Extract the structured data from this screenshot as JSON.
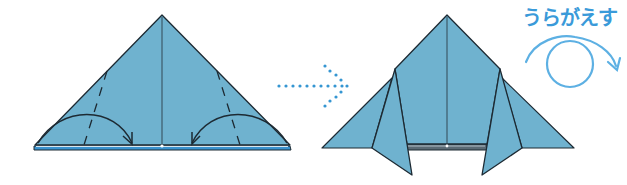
{
  "instruction": {
    "flip_label": "うらがえす"
  },
  "colors": {
    "paper_fill": "#6fb2cf",
    "paper_edge": "#1d2a33",
    "accent_blue": "#4aa3d8",
    "arrow_blue": "#2f8fd0",
    "base_strip": "#3a93cf"
  },
  "steps": [
    {
      "id": "step-before",
      "description": "Triangle with dashed valley-fold lines and curved arrows folding corners toward the center"
    },
    {
      "id": "step-after",
      "description": "Shape with both side corners folded, flaps extending below base"
    }
  ],
  "icons": {
    "transition_arrow": "dotted-arrow-right",
    "flip_symbol": "flip-over-loop-arrow"
  }
}
